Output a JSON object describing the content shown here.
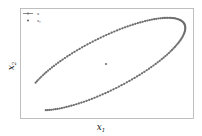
{
  "chart_data": {
    "type": "scatter",
    "title": "",
    "xlabel": "x_1",
    "ylabel": "x_2",
    "xlabel_display": {
      "base": "x",
      "sub": "1"
    },
    "ylabel_display": {
      "base": "x",
      "sub": "2"
    },
    "ticks": {
      "x": [],
      "y": []
    },
    "grid": false,
    "legend_position": "upper left",
    "legend": [
      {
        "label": "x",
        "label_display": {
          "base": "x",
          "sub": ""
        },
        "style": "line-with-markers"
      },
      {
        "label": "x_r",
        "label_display": {
          "base": "x",
          "sub": "r"
        },
        "style": "marker"
      }
    ],
    "series": [
      {
        "name": "x",
        "kind": "trajectory",
        "description": "Tilted elliptical orbit traced by markers; open gap at bottom between start and end",
        "color": "#6e6e6e",
        "marker_size_px": 2.2,
        "ellipse_pixel_params": {
          "center": [
            106,
            64
          ],
          "semi_major": 88,
          "semi_minor": 26,
          "rotation_deg": -27,
          "start_angle_deg": 216,
          "end_angle_deg": 508,
          "n_points": 150
        }
      },
      {
        "name": "x_r",
        "kind": "point",
        "description": "Single reference point at the center of the ellipse",
        "color": "#6e6e6e",
        "pixel": [
          106,
          64
        ]
      }
    ]
  },
  "colors": {
    "marker": "#6e6e6e",
    "frame": "#b0b0b0",
    "text": "#222222",
    "background": "#ffffff"
  }
}
